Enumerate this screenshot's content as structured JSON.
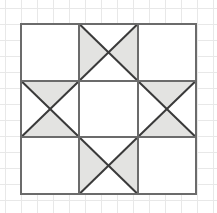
{
  "figure": {
    "canvas": {
      "width": 217,
      "height": 213
    },
    "background": {
      "color": "#ffffff",
      "graph_paper": {
        "visible": true,
        "line_color": "#e8e8e8",
        "spacing": 16,
        "origin_x": 5,
        "origin_y": 8
      }
    },
    "block": {
      "x": 21,
      "y": 24,
      "width": 175,
      "height": 170,
      "rows": 3,
      "cols": 3,
      "outline_color": "#6b6b6b",
      "outline_width": 2,
      "cell_line_color": "#6b6b6b",
      "cell_line_width": 2,
      "diagonal_color": "#3a3a3a",
      "diagonal_width": 2,
      "fill_white": "#ffffff",
      "fill_gray": "#e3e3e1"
    },
    "cells": [
      {
        "name": "top-left",
        "row": 0,
        "col": 0,
        "type": "plain",
        "fill": "white",
        "diagonals": "none",
        "shaded_triangles": []
      },
      {
        "name": "top-center",
        "row": 0,
        "col": 1,
        "type": "hourglass-horizontal",
        "fill": "mixed",
        "diagonals": "both",
        "shaded_triangles": [
          "left",
          "right"
        ]
      },
      {
        "name": "top-right",
        "row": 0,
        "col": 2,
        "type": "plain",
        "fill": "white",
        "diagonals": "none",
        "shaded_triangles": []
      },
      {
        "name": "middle-left",
        "row": 1,
        "col": 0,
        "type": "hourglass-vertical",
        "fill": "mixed",
        "diagonals": "both",
        "shaded_triangles": [
          "top",
          "bottom"
        ]
      },
      {
        "name": "center",
        "row": 1,
        "col": 1,
        "type": "plain",
        "fill": "white",
        "diagonals": "none",
        "shaded_triangles": []
      },
      {
        "name": "middle-right",
        "row": 1,
        "col": 2,
        "type": "hourglass-vertical",
        "fill": "mixed",
        "diagonals": "both",
        "shaded_triangles": [
          "top",
          "bottom"
        ]
      },
      {
        "name": "bottom-left",
        "row": 2,
        "col": 0,
        "type": "plain",
        "fill": "white",
        "diagonals": "none",
        "shaded_triangles": []
      },
      {
        "name": "bottom-center",
        "row": 2,
        "col": 1,
        "type": "hourglass-horizontal",
        "fill": "mixed",
        "diagonals": "both",
        "shaded_triangles": [
          "left",
          "right"
        ]
      },
      {
        "name": "bottom-right",
        "row": 2,
        "col": 2,
        "type": "plain",
        "fill": "white",
        "diagonals": "none",
        "shaded_triangles": []
      }
    ]
  }
}
